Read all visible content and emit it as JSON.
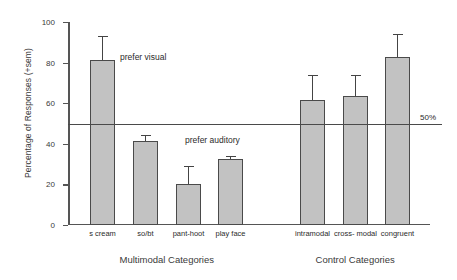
{
  "chart_data": {
    "type": "bar",
    "title": "",
    "xlabel": "",
    "ylabel": "Percentage of Responses (+sem)",
    "ylim": [
      0,
      100
    ],
    "yticks": [
      0,
      20,
      40,
      60,
      80,
      100
    ],
    "ytick_labels": [
      "0",
      "20",
      "40",
      "60",
      "80",
      "100"
    ],
    "grid": false,
    "legend": "none",
    "categories": [
      "s cream",
      "so/bt",
      "pant-hoot",
      "play face",
      "intramodal",
      "cross- modal",
      "congruent"
    ],
    "values": [
      81.5,
      41.5,
      20.0,
      32.5,
      61.5,
      63.5,
      83.0
    ],
    "errors": [
      11.5,
      3.0,
      9.0,
      1.5,
      12.5,
      10.5,
      11.0
    ],
    "groups": [
      {
        "label": "Multimodal Categories",
        "categories": [
          "s cream",
          "so/bt",
          "pant-hoot",
          "play face"
        ]
      },
      {
        "label": "Control Categories",
        "categories": [
          "intramodal",
          "cross- modal",
          "congruent"
        ]
      }
    ],
    "reference_line": {
      "value": 50,
      "label": "50%"
    },
    "annotations": [
      {
        "text": "prefer visual",
        "x_value": 1.55,
        "y_value": 75
      },
      {
        "text": "prefer auditory",
        "x_value": 2.85,
        "y_value": 44
      }
    ],
    "bar_color": "#c2c2c2",
    "bar_edge_color": "#4a4a4a",
    "axis_color": "#555555"
  }
}
